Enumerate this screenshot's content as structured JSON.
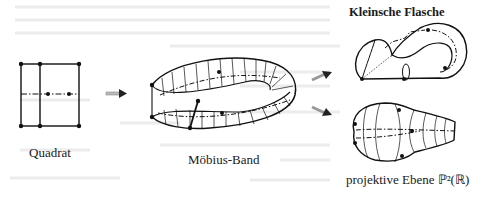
{
  "figure": {
    "labels": {
      "square": "Quadrat",
      "moebius": "Möbius-Band",
      "klein": "Kleinsche Flasche",
      "projective": "projektive Ebene ℙ²(ℝ)"
    },
    "arrows": [
      {
        "from": "square",
        "to": "moebius"
      },
      {
        "from": "moebius",
        "to": "klein"
      },
      {
        "from": "moebius",
        "to": "projective"
      }
    ]
  }
}
